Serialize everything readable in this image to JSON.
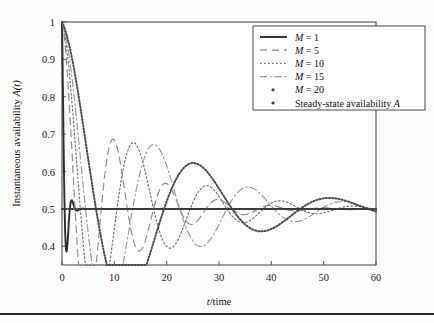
{
  "figure": {
    "name": "instantaneous-availability-plot",
    "background": "#fefefe",
    "footer_rule": true
  },
  "axes": {
    "x_label_prefix": "t",
    "x_label_suffix": "/time",
    "y_label_prefix": "Instantaneous availability ",
    "y_label_var": "A",
    "y_label_arg": "(t)",
    "x_ticks": [
      "0",
      "10",
      "20",
      "30",
      "40",
      "50",
      "60"
    ],
    "y_ticks": [
      "0.4",
      "0.5",
      "0.6",
      "0.7",
      "0.8",
      "0.9",
      "1"
    ]
  },
  "legend": {
    "entries": [
      {
        "label": "M = 1",
        "style": "solid",
        "color": "#2e2e2e"
      },
      {
        "label": "M = 5",
        "style": "dashed",
        "color": "#8a8a8a"
      },
      {
        "label": "M = 10",
        "style": "dotted",
        "color": "#6e6e6e"
      },
      {
        "label": "M = 15",
        "style": "dashdot",
        "color": "#9a9a9a"
      },
      {
        "label": "M = 20",
        "style": "marker",
        "color": "#4a4a4a"
      },
      {
        "label": "Steady-state availability A",
        "style": "marker",
        "color": "#3a3a3a"
      }
    ]
  },
  "chart_data": {
    "type": "line",
    "title": "",
    "xlabel": "t/time",
    "ylabel": "Instantaneous availability A(t)",
    "xlim": [
      0,
      60
    ],
    "ylim": [
      0.35,
      1.0
    ],
    "xticks": [
      0,
      10,
      20,
      30,
      40,
      50,
      60
    ],
    "yticks": [
      0.4,
      0.5,
      0.6,
      0.7,
      0.8,
      0.9,
      1.0
    ],
    "grid": false,
    "legend_position": "top-right",
    "steady_state_value": 0.5,
    "series": [
      {
        "name": "M = 1",
        "style": "solid",
        "color": "#2e2e2e",
        "model": "damped_oscillation",
        "period": 2.0,
        "damping": 1.6,
        "amplitude": 0.5,
        "asymptote": 0.5,
        "x": [
          0,
          0.3,
          0.6,
          0.9,
          1.2,
          1.5,
          1.8,
          2.1,
          2.5,
          3.0,
          4.0,
          6.0,
          10,
          20,
          40,
          60
        ],
        "y": [
          1.0,
          0.78,
          0.55,
          0.41,
          0.4,
          0.46,
          0.52,
          0.54,
          0.52,
          0.505,
          0.5,
          0.5,
          0.5,
          0.5,
          0.5,
          0.5
        ]
      },
      {
        "name": "M = 5",
        "style": "dashed",
        "color": "#8a8a8a",
        "model": "damped_oscillation",
        "period": 10.0,
        "damping": 0.1,
        "amplitude": 0.5,
        "asymptote": 0.5,
        "x": [
          0,
          2,
          4,
          6,
          8,
          10,
          12,
          14,
          16,
          18,
          20,
          25,
          30,
          35,
          40,
          50,
          60
        ],
        "y": [
          1.0,
          0.82,
          0.63,
          0.47,
          0.39,
          0.4,
          0.47,
          0.54,
          0.57,
          0.55,
          0.51,
          0.45,
          0.49,
          0.53,
          0.52,
          0.5,
          0.5
        ]
      },
      {
        "name": "M = 10",
        "style": "dotted",
        "color": "#6e6e6e",
        "model": "damped_oscillation",
        "period": 14.0,
        "damping": 0.075,
        "amplitude": 0.5,
        "asymptote": 0.5,
        "x": [
          0,
          2,
          4,
          6,
          8,
          10,
          12,
          14,
          16,
          18,
          20,
          24,
          28,
          32,
          36,
          42,
          50,
          60
        ],
        "y": [
          1.0,
          0.88,
          0.74,
          0.61,
          0.5,
          0.42,
          0.38,
          0.4,
          0.46,
          0.52,
          0.56,
          0.56,
          0.5,
          0.45,
          0.46,
          0.51,
          0.5,
          0.5
        ]
      },
      {
        "name": "M = 15",
        "style": "dashdot",
        "color": "#9a9a9a",
        "model": "damped_oscillation",
        "period": 18.0,
        "damping": 0.06,
        "amplitude": 0.5,
        "asymptote": 0.5,
        "x": [
          0,
          3,
          6,
          9,
          12,
          15,
          18,
          21,
          24,
          27,
          30,
          34,
          38,
          44,
          50,
          60
        ],
        "y": [
          1.0,
          0.87,
          0.73,
          0.59,
          0.47,
          0.4,
          0.39,
          0.44,
          0.51,
          0.56,
          0.57,
          0.53,
          0.48,
          0.48,
          0.5,
          0.5
        ]
      },
      {
        "name": "M = 20",
        "style": "marker",
        "color": "#4a4a4a",
        "model": "damped_oscillation",
        "period": 26.0,
        "damping": 0.055,
        "amplitude": 0.5,
        "asymptote": 0.5,
        "x": [
          0,
          4,
          8,
          12,
          16,
          20,
          22,
          26,
          30,
          33,
          36,
          40,
          45,
          50,
          55,
          60
        ],
        "y": [
          1.0,
          0.88,
          0.76,
          0.62,
          0.48,
          0.375,
          0.4,
          0.47,
          0.53,
          0.545,
          0.54,
          0.52,
          0.505,
          0.5,
          0.5,
          0.5
        ]
      },
      {
        "name": "Steady-state availability A",
        "style": "marker",
        "color": "#3a3a3a",
        "model": "constant",
        "asymptote": 0.5,
        "x": [
          0,
          60
        ],
        "y": [
          0.5,
          0.5
        ]
      }
    ]
  }
}
